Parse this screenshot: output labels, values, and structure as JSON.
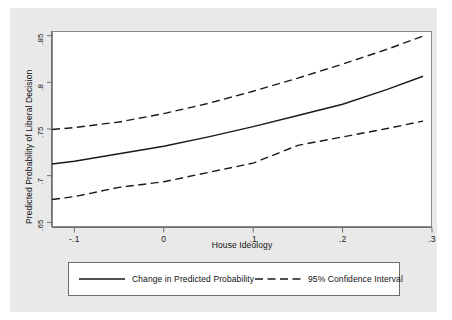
{
  "chart_data": {
    "type": "line",
    "title": "",
    "xlabel": "House Ideology",
    "ylabel": "Predicted Probability of Liberal Decision",
    "xlim": [
      -0.125,
      0.3
    ],
    "ylim": [
      0.645,
      0.855
    ],
    "xticks": [
      "-.1",
      "0",
      ".1",
      ".2",
      ".3"
    ],
    "xtick_values": [
      -0.1,
      0,
      0.1,
      0.2,
      0.3
    ],
    "yticks": [
      ".65",
      ".7",
      ".75",
      ".8",
      ".85"
    ],
    "ytick_values": [
      0.65,
      0.7,
      0.75,
      0.8,
      0.85
    ],
    "grid": false,
    "legend_position": "below",
    "x": [
      -0.125,
      -0.1,
      -0.05,
      0.0,
      0.05,
      0.1,
      0.15,
      0.2,
      0.25,
      0.29
    ],
    "series": [
      {
        "name": "Change in Predicted Probability",
        "style": "solid",
        "color": "#1a1a1a",
        "values": [
          0.7125,
          0.7155,
          0.7235,
          0.7315,
          0.7415,
          0.7525,
          0.7645,
          0.7765,
          0.7925,
          0.8065
        ]
      },
      {
        "name": "95% Confidence Interval (upper)",
        "style": "dashed",
        "color": "#1a1a1a",
        "values": [
          0.7495,
          0.7515,
          0.7575,
          0.7665,
          0.7775,
          0.7905,
          0.8045,
          0.8195,
          0.8355,
          0.8495
        ]
      },
      {
        "name": "95% Confidence Interval (lower)",
        "style": "dashed",
        "color": "#1a1a1a",
        "values": [
          0.6745,
          0.6775,
          0.6875,
          0.6935,
          0.7035,
          0.7135,
          0.7325,
          0.7415,
          0.7505,
          0.7585
        ]
      }
    ]
  },
  "legend": {
    "entries": [
      {
        "label": "Change in Predicted Probability",
        "style": "solid"
      },
      {
        "label": "95% Confidence Interval",
        "style": "dashed"
      }
    ]
  },
  "axis": {
    "x_label": "House Ideology",
    "y_label": "Predicted Probability of Liberal Decision",
    "x_ticks": [
      "-.1",
      "0",
      ".1",
      ".2",
      ".3"
    ],
    "y_ticks": [
      ".85",
      ".8",
      ".75",
      ".7",
      ".65"
    ]
  },
  "colors": {
    "graph_region": "#e9e9e9",
    "plot_region": "#ffffff",
    "line": "#1a1a1a",
    "axis": "#6e6e6e"
  }
}
